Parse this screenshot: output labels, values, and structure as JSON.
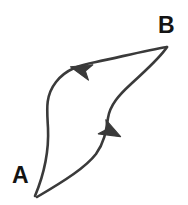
{
  "diagram": {
    "type": "closed-loop-cycle",
    "background_color": "#ffffff",
    "stroke_color": "#3a3a3a",
    "label_color": "#141414",
    "stroke_width": 2.6,
    "labels": {
      "start": "A",
      "end": "B"
    },
    "nodes": [
      {
        "id": "A",
        "label": "A",
        "x": 35,
        "y": 196
      },
      {
        "id": "B",
        "label": "B",
        "x": 166,
        "y": 47
      }
    ],
    "paths": [
      {
        "id": "upper-branch",
        "name": "outbound-path-a-to-b",
        "direction": "A to B",
        "d": "M 35 196 C 45 172, 49 150, 48 128 C 47 110, 45 96, 56 82 C 66 69, 80 65, 96 62 C 120 57, 148 50, 167 47"
      },
      {
        "id": "lower-branch",
        "name": "return-path-b-to-a",
        "direction": "B to A",
        "d": "M 167 47 C 160 58, 146 70, 131 84 C 119 95, 110 105, 108 118 C 106 132, 104 143, 96 154 C 86 167, 66 180, 37 197"
      }
    ],
    "arrows": [
      {
        "id": "arrow-upper",
        "name": "upper-direction-arrow",
        "x": 82,
        "y": 70,
        "angle": 196,
        "points_toward": "A"
      },
      {
        "id": "arrow-lower",
        "name": "lower-direction-arrow",
        "x": 110,
        "y": 131,
        "angle": 28,
        "points_toward": "A"
      }
    ]
  }
}
